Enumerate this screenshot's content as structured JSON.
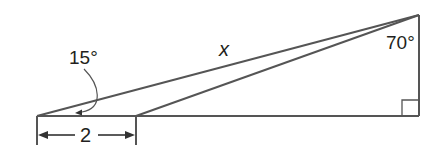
{
  "diagram": {
    "type": "right-triangle-geometry",
    "colors": {
      "line": "#555555",
      "text": "#231f20",
      "background": "#ffffff"
    },
    "labels": {
      "angle_left": "15°",
      "side_hypotenuse": "x",
      "angle_top": "70°",
      "base_segment": "2"
    },
    "points": {
      "A": [
        37,
        116
      ],
      "B": [
        136,
        116
      ],
      "C": [
        419,
        15
      ],
      "D": [
        419,
        116
      ]
    },
    "right_angle_at": "D"
  }
}
